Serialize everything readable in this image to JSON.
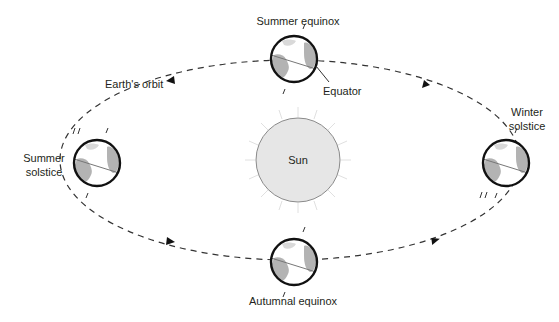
{
  "diagram": {
    "sun": {
      "label": "Sun",
      "fill": "#e6e6e6",
      "stroke": "#8a8a8a"
    },
    "orbit": {
      "label": "Earth's orbit",
      "stroke": "#333333"
    },
    "earth": {
      "stroke": "#111111",
      "land": "#b3b3b3",
      "ocean": "#ffffff",
      "equator_stroke": "#777777"
    },
    "positions": [
      {
        "id": "summer-equinox",
        "label_lines": [
          "Summer equinox"
        ]
      },
      {
        "id": "winter-solstice",
        "label_lines": [
          "Winter",
          "solstice"
        ]
      },
      {
        "id": "autumnal-equinox",
        "label_lines": [
          "Autumnal equinox"
        ]
      },
      {
        "id": "summer-solstice",
        "label_lines": [
          "Summer",
          "solstice"
        ]
      }
    ],
    "annotations": {
      "equator": "Equator"
    }
  }
}
